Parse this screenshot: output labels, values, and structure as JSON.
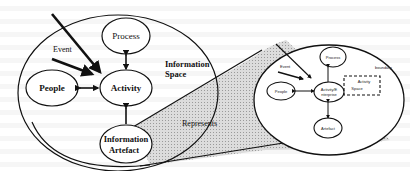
{
  "diagram": {
    "left": {
      "space_label_line1": "Information",
      "space_label_line2": "Space",
      "nodes": {
        "process": "Process",
        "people": "People",
        "activity": "Activity",
        "artefact_line1": "Information",
        "artefact_line2": "Artefact"
      },
      "event_label": "Event"
    },
    "connector_label": "Represents",
    "right": {
      "nodes": {
        "process": "Process",
        "people": "People",
        "activity_line1": "Activity/E",
        "activity_line2": "nterprise",
        "artefact": "Artefact"
      },
      "event_label": "Event",
      "boundary_label": "boundary",
      "activity_space_line1": "Activity",
      "activity_space_line2": "Space"
    },
    "colors": {
      "stroke": "#111111",
      "shade": "#d4d4d4",
      "background": "#ffffff"
    }
  }
}
